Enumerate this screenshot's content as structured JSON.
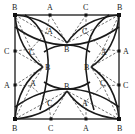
{
  "diagram": {
    "type": "geometry-construction",
    "stroke_color": "#1a1a1a",
    "points": [
      {
        "id": "B_tl",
        "label": "B",
        "x": 15,
        "y": 15
      },
      {
        "id": "B_tr",
        "label": "B",
        "x": 119,
        "y": 15
      },
      {
        "id": "B_bl",
        "label": "B",
        "x": 15,
        "y": 119
      },
      {
        "id": "B_br",
        "label": "B",
        "x": 119,
        "y": 119
      },
      {
        "id": "A_top",
        "label": "A",
        "x": 50,
        "y": 15
      },
      {
        "id": "C_top",
        "label": "C",
        "x": 86,
        "y": 15
      },
      {
        "id": "C_left",
        "label": "C",
        "x": 15,
        "y": 51
      },
      {
        "id": "A_left",
        "label": "A",
        "x": 15,
        "y": 85
      },
      {
        "id": "A_right",
        "label": "A",
        "x": 119,
        "y": 51
      },
      {
        "id": "C_right",
        "label": "C",
        "x": 119,
        "y": 85
      },
      {
        "id": "C_bottom",
        "label": "C",
        "x": 51,
        "y": 119
      },
      {
        "id": "A_bottom",
        "label": "A",
        "x": 86,
        "y": 119
      },
      {
        "id": "A_in_tl",
        "label": "A",
        "x": 46,
        "y": 33
      },
      {
        "id": "C_in_tl",
        "label": "C",
        "x": 31,
        "y": 49
      },
      {
        "id": "C_in_tr",
        "label": "C",
        "x": 86,
        "y": 33
      },
      {
        "id": "A_in_tr",
        "label": "A",
        "x": 103,
        "y": 49
      },
      {
        "id": "A_in_bl",
        "label": "A",
        "x": 31,
        "y": 86
      },
      {
        "id": "C_in_bl",
        "label": "C",
        "x": 48,
        "y": 101
      },
      {
        "id": "C_in_br",
        "label": "C",
        "x": 103,
        "y": 86
      },
      {
        "id": "A_in_br",
        "label": "A",
        "x": 86,
        "y": 101
      },
      {
        "id": "B_in_top",
        "label": "B",
        "x": 67,
        "y": 43
      },
      {
        "id": "B_in_left",
        "label": "B",
        "x": 43,
        "y": 67
      },
      {
        "id": "B_in_right",
        "label": "B",
        "x": 91,
        "y": 67
      },
      {
        "id": "B_in_bottom",
        "label": "B",
        "x": 67,
        "y": 91
      }
    ],
    "labels": {
      "corner_tl": "B",
      "corner_tr": "B",
      "corner_bl": "B",
      "corner_br": "B",
      "top_a": "A",
      "top_c": "C",
      "left_c": "C",
      "left_a": "A",
      "right_a": "A",
      "right_c": "C",
      "bottom_c": "C",
      "bottom_a": "A",
      "in_tl_a": "A",
      "in_tl_c": "C",
      "in_tr_c": "C",
      "in_tr_a": "A",
      "in_bl_a": "A",
      "in_bl_c": "C",
      "in_br_c": "C",
      "in_br_a": "A",
      "in_top_b": "B",
      "in_left_b": "B",
      "in_right_b": "B",
      "in_bottom_b": "B"
    }
  }
}
